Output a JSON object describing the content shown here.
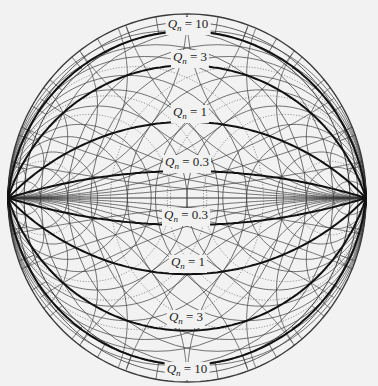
{
  "figure": {
    "type": "smith-chart-with-constant-q-contours",
    "background": "#f2f2f2",
    "grid_color": "#3a3a3a",
    "q_arc_color": "#111111"
  },
  "chart_data": {
    "type": "diagram",
    "title": "",
    "q_contours": [
      {
        "label_symbol": "Q",
        "label_subscript": "n",
        "value": "10",
        "half": "upper"
      },
      {
        "label_symbol": "Q",
        "label_subscript": "n",
        "value": "3",
        "half": "upper"
      },
      {
        "label_symbol": "Q",
        "label_subscript": "n",
        "value": "1",
        "half": "upper"
      },
      {
        "label_symbol": "Q",
        "label_subscript": "n",
        "value": "0.3",
        "half": "upper"
      },
      {
        "label_symbol": "Q",
        "label_subscript": "n",
        "value": "0.3",
        "half": "lower"
      },
      {
        "label_symbol": "Q",
        "label_subscript": "n",
        "value": "1",
        "half": "lower"
      },
      {
        "label_symbol": "Q",
        "label_subscript": "n",
        "value": "3",
        "half": "lower"
      },
      {
        "label_symbol": "Q",
        "label_subscript": "n",
        "value": "10",
        "half": "lower"
      }
    ],
    "resistance_circles": [
      0.2,
      0.5,
      1,
      2,
      5
    ],
    "reactance_arcs": [
      0.2,
      0.5,
      1,
      2,
      5
    ]
  },
  "labels": [
    {
      "sym": "Q",
      "sub": "n",
      "eq": " = 10",
      "x": 188,
      "y": 17
    },
    {
      "sym": "Q",
      "sub": "n",
      "eq": " = 3",
      "x": 190,
      "y": 50
    },
    {
      "sym": "Q",
      "sub": "n",
      "eq": " = 1",
      "x": 190,
      "y": 105
    },
    {
      "sym": "Q",
      "sub": "n",
      "eq": " = 0.3",
      "x": 187,
      "y": 155
    },
    {
      "sym": "Q",
      "sub": "n",
      "eq": " = 0.3",
      "x": 186,
      "y": 208
    },
    {
      "sym": "Q",
      "sub": "n",
      "eq": " = 1",
      "x": 188,
      "y": 255
    },
    {
      "sym": "Q",
      "sub": "n",
      "eq": " = 3",
      "x": 186,
      "y": 310
    },
    {
      "sym": "Q",
      "sub": "n",
      "eq": " = 10",
      "x": 187,
      "y": 362
    }
  ]
}
